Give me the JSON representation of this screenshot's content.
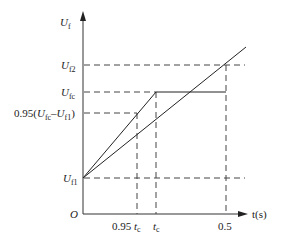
{
  "diagram": {
    "y_axis_label": "U",
    "y_axis_sub": "f",
    "x_axis_label": "t(s)",
    "origin_label": "O",
    "y_ticks": [
      {
        "main": "U",
        "sub": "f2",
        "y": 65
      },
      {
        "main": "U",
        "sub": "fc",
        "y": 92
      },
      {
        "prefix": "0.95(",
        "main": "U",
        "sub": "fc",
        "mid": "–",
        "main2": "U",
        "sub2": "f1",
        "suffix": ")",
        "y": 113
      },
      {
        "main": "U",
        "sub": "f1",
        "y": 178
      }
    ],
    "x_ticks": [
      {
        "prefix": "0.95 ",
        "main": "t",
        "sub": "c",
        "x": 137
      },
      {
        "main": "t",
        "sub": "c",
        "x": 156
      },
      {
        "label": "0.5",
        "x": 226
      }
    ],
    "lines": {
      "steep": [
        [
          83,
          178
        ],
        [
          156,
          92
        ],
        [
          226,
          92
        ]
      ],
      "shallow": [
        [
          83,
          178
        ],
        [
          246,
          47
        ]
      ]
    }
  }
}
